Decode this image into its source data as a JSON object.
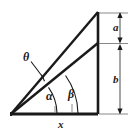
{
  "figure": {
    "type": "geometry-diagram",
    "background_color": "#ffffff",
    "stroke_color": "#1a1a1a",
    "labels": {
      "theta": "θ",
      "alpha": "α",
      "beta": "β",
      "segment_a": "a",
      "segment_b": "b",
      "base_x": "x"
    },
    "geometry": {
      "vertex_left": [
        11,
        114
      ],
      "vertex_right_bottom": [
        98,
        114
      ],
      "vertex_apex": [
        98,
        12
      ],
      "cevian_end": [
        98,
        43
      ],
      "dimension_line_x": 120,
      "dimension_a_top": 13,
      "dimension_a_bottom": 42,
      "dimension_b_top": 45,
      "dimension_b_bottom": 114,
      "theta_leader_from": [
        31,
        62
      ],
      "theta_leader_to": [
        43,
        77
      ]
    }
  }
}
